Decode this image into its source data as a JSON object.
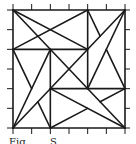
{
  "figure": {
    "type": "geometric-dissection-diagram",
    "grid": {
      "divisions": 6,
      "origin_px": [
        13,
        10
      ],
      "size_px": [
        112,
        118
      ]
    },
    "stroke_color": "#1a1a1a",
    "tick_color": "#1a1a1a",
    "segments": [
      [
        [
          0,
          0
        ],
        [
          6,
          0
        ]
      ],
      [
        [
          6,
          0
        ],
        [
          6,
          6
        ]
      ],
      [
        [
          6,
          6
        ],
        [
          0,
          6
        ]
      ],
      [
        [
          0,
          6
        ],
        [
          0,
          0
        ]
      ],
      [
        [
          0,
          2
        ],
        [
          4,
          2
        ]
      ],
      [
        [
          4,
          0
        ],
        [
          4,
          4
        ]
      ],
      [
        [
          2,
          4
        ],
        [
          6,
          4
        ]
      ],
      [
        [
          2,
          2
        ],
        [
          2,
          6
        ]
      ],
      [
        [
          0,
          0
        ],
        [
          6,
          6
        ]
      ],
      [
        [
          6,
          0
        ],
        [
          0,
          6
        ]
      ],
      [
        [
          0,
          0
        ],
        [
          4,
          2
        ]
      ],
      [
        [
          0,
          2
        ],
        [
          4,
          0
        ]
      ],
      [
        [
          6,
          0
        ],
        [
          4,
          4
        ]
      ],
      [
        [
          4,
          0
        ],
        [
          4.667,
          1.333
        ]
      ],
      [
        [
          5,
          2
        ],
        [
          6,
          4
        ]
      ],
      [
        [
          6,
          6
        ],
        [
          2,
          4
        ]
      ],
      [
        [
          6,
          4
        ],
        [
          4.667,
          4.667
        ]
      ],
      [
        [
          2,
          6
        ],
        [
          4,
          5
        ]
      ],
      [
        [
          0,
          6
        ],
        [
          2,
          2
        ]
      ],
      [
        [
          0,
          2
        ],
        [
          1,
          4
        ]
      ],
      [
        [
          2,
          6
        ],
        [
          1.333,
          4.667
        ]
      ]
    ]
  },
  "caption": {
    "parts": [
      "Fig.",
      "S"
    ]
  }
}
